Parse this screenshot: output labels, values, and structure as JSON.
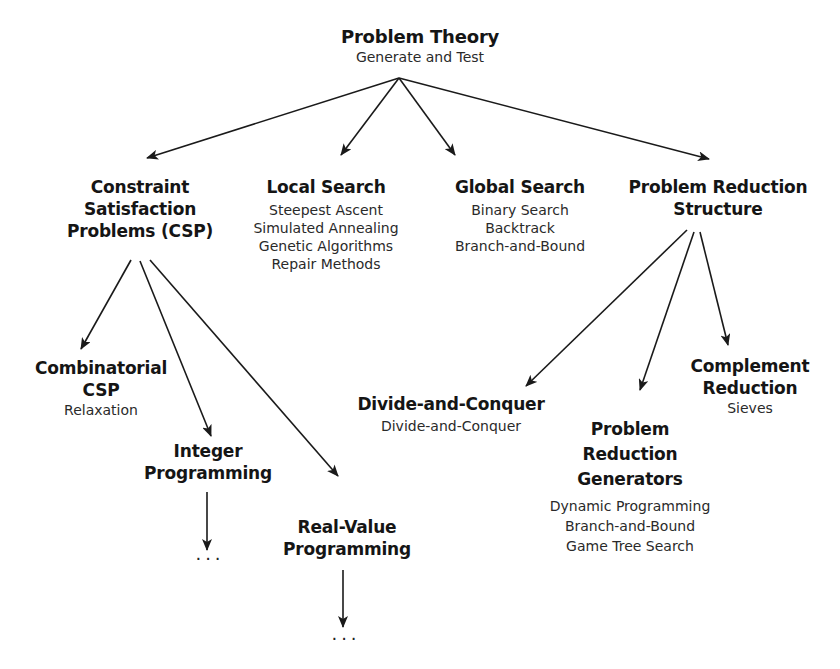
{
  "root": {
    "title": "Problem Theory",
    "subtitle": "Generate and Test"
  },
  "level1": {
    "csp": {
      "title_lines": [
        "Constraint",
        "Satisfaction",
        "Problems (CSP)"
      ]
    },
    "local_search": {
      "title": "Local Search",
      "items": [
        "Steepest Ascent",
        "Simulated Annealing",
        "Genetic Algorithms",
        "Repair Methods"
      ]
    },
    "global_search": {
      "title": "Global Search",
      "items": [
        "Binary Search",
        "Backtrack",
        "Branch-and-Bound"
      ]
    },
    "problem_reduction_structure": {
      "title_lines": [
        "Problem Reduction",
        "Structure"
      ]
    }
  },
  "csp_children": {
    "combinatorial": {
      "title_lines": [
        "Combinatorial",
        "CSP"
      ],
      "items": [
        "Relaxation"
      ]
    },
    "integer": {
      "title_lines": [
        "Integer",
        "Programming"
      ],
      "continuation": "..."
    },
    "real_value": {
      "title_lines": [
        "Real-Value",
        "Programming"
      ],
      "continuation": "..."
    }
  },
  "prs_children": {
    "divide_conquer": {
      "title": "Divide-and-Conquer",
      "items": [
        "Divide-and-Conquer"
      ]
    },
    "generators": {
      "title_lines": [
        "Problem",
        "Reduction",
        "Generators"
      ],
      "items": [
        "Dynamic Programming",
        "Branch-and-Bound",
        "Game Tree Search"
      ]
    },
    "complement": {
      "title_lines": [
        "Complement",
        "Reduction"
      ],
      "items": [
        "Sieves"
      ]
    }
  },
  "edges": [
    {
      "from": "Problem Theory",
      "to": "Constraint Satisfaction Problems (CSP)"
    },
    {
      "from": "Problem Theory",
      "to": "Local Search"
    },
    {
      "from": "Problem Theory",
      "to": "Global Search"
    },
    {
      "from": "Problem Theory",
      "to": "Problem Reduction Structure"
    },
    {
      "from": "Constraint Satisfaction Problems (CSP)",
      "to": "Combinatorial CSP"
    },
    {
      "from": "Constraint Satisfaction Problems (CSP)",
      "to": "Integer Programming"
    },
    {
      "from": "Constraint Satisfaction Problems (CSP)",
      "to": "Real-Value Programming"
    },
    {
      "from": "Problem Reduction Structure",
      "to": "Divide-and-Conquer"
    },
    {
      "from": "Problem Reduction Structure",
      "to": "Problem Reduction Generators"
    },
    {
      "from": "Problem Reduction Structure",
      "to": "Complement Reduction"
    },
    {
      "from": "Integer Programming",
      "to": "..."
    },
    {
      "from": "Real-Value Programming",
      "to": "..."
    }
  ],
  "colors": {
    "text": "#1a1a1a",
    "edge": "#1a1a1a",
    "background": "#ffffff"
  }
}
